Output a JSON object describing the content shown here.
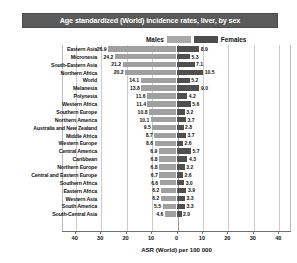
{
  "title": "Age standardized (World) incidence rates, liver, by sex",
  "legend": {
    "male_label": "Males",
    "female_label": "Females",
    "male_color": "#a0a0a0",
    "female_color": "#4f4f4f"
  },
  "chart_data": {
    "type": "bar",
    "orientation": "horizontal-diverging",
    "title": "Age standardized (World) incidence rates, liver, by sex",
    "xlabel": "ASR (World) per 100 000",
    "ylabel": "",
    "xlim": [
      -45,
      45
    ],
    "xticks": [
      40,
      30,
      20,
      10,
      0,
      10,
      20,
      30,
      40
    ],
    "xtick_labels": [
      "40",
      "30",
      "20",
      "10",
      "0",
      "10",
      "20",
      "30",
      "40"
    ],
    "grid": true,
    "legend_position": "top-center",
    "categories": [
      "Eastern Asia",
      "Micronesia",
      "South-Eastern Asia",
      "Northern Africa",
      "World",
      "Melanesia",
      "Polynesia",
      "Western Africa",
      "Southern Europe",
      "Northern America",
      "Australia and New Zealand",
      "Middle Africa",
      "Western Europe",
      "Central America",
      "Caribbean",
      "Northern Europe",
      "Central and Eastern Europe",
      "Southern Africa",
      "Eastern Africa",
      "Western Asia",
      "South America",
      "South-Central Asia"
    ],
    "series": [
      {
        "name": "Males",
        "color": "#a0a0a0",
        "direction": "left",
        "values": [
          26.9,
          24.2,
          21.2,
          20.2,
          14.1,
          13.8,
          11.6,
          11.4,
          10.8,
          10.1,
          9.5,
          8.7,
          8.6,
          6.9,
          6.8,
          6.8,
          6.7,
          6.6,
          6.2,
          6.2,
          5.5,
          4.6
        ]
      },
      {
        "name": "Females",
        "color": "#4f4f4f",
        "direction": "right",
        "values": [
          8.9,
          5.3,
          7.1,
          10.5,
          5.2,
          9.0,
          4.2,
          5.6,
          3.2,
          3.7,
          2.8,
          3.7,
          2.6,
          5.7,
          4.3,
          3.2,
          2.6,
          3.0,
          3.9,
          3.3,
          3.3,
          2.0
        ]
      }
    ]
  }
}
